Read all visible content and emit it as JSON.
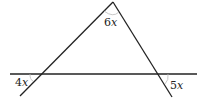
{
  "diagram": {
    "type": "geometry",
    "colors": {
      "line": "#222222",
      "arc": "#bbbbbb",
      "background": "#ffffff"
    },
    "angles": [
      {
        "id": "apex",
        "coefficient": "6",
        "variable": "x",
        "position": "interior angle at top vertex"
      },
      {
        "id": "left",
        "coefficient": "4",
        "variable": "x",
        "position": "exterior angle at left intersection, below line, left side"
      },
      {
        "id": "right",
        "coefficient": "5",
        "variable": "x",
        "position": "exterior angle at right intersection, below line, right side"
      }
    ]
  }
}
